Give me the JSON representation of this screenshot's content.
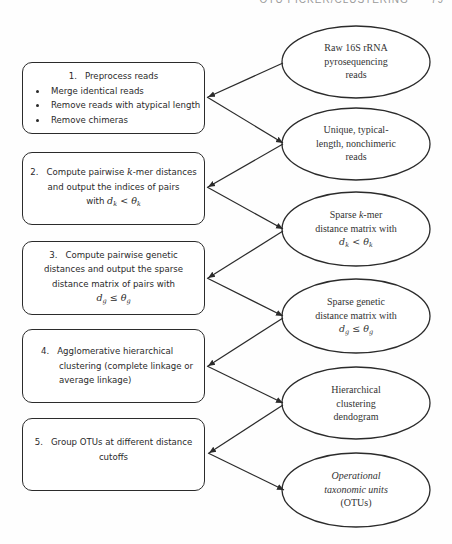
{
  "header": {
    "running_title": "OTU PICKER/CLUSTERING",
    "page_number": "79"
  },
  "steps": [
    {
      "number": "1.",
      "title": "Preprocess reads",
      "bullets": [
        "Merge identical reads",
        "Remove reads with atypical length",
        "Remove chimeras"
      ]
    },
    {
      "number": "2.",
      "line1_pre": "Compute pairwise ",
      "line1_var": "k",
      "line1_post": "-mer distances",
      "line2": "and output the indices of pairs",
      "line3_pre": "with ",
      "math": {
        "d": "d",
        "d_sub": "k",
        "op": "<",
        "theta": "θ",
        "theta_sub": "k"
      }
    },
    {
      "number": "3.",
      "line1": "Compute pairwise genetic",
      "line2": "distances and output the sparse",
      "line3": "distance matrix of pairs with",
      "math": {
        "d": "d",
        "d_sub": "g",
        "op": "≤",
        "theta": "θ",
        "theta_sub": "g"
      }
    },
    {
      "number": "4.",
      "line1": "Agglomerative hierarchical",
      "line2": "clustering (complete linkage or",
      "line3": "average linkage)"
    },
    {
      "number": "5.",
      "line1": "Group OTUs at different distance",
      "line2": "cutoffs"
    }
  ],
  "data_nodes": [
    {
      "lines": [
        "Raw 16S rRNA",
        "pyrosequencing",
        "reads"
      ]
    },
    {
      "lines": [
        "Unique, typical-",
        "length, nonchimeric",
        "reads"
      ]
    },
    {
      "line1_pre": "Sparse ",
      "line1_var": "k",
      "line1_post": "-mer",
      "line2": "distance matrix with",
      "math": {
        "d": "d",
        "d_sub": "k",
        "op": "<",
        "theta": "θ",
        "theta_sub": "k"
      }
    },
    {
      "line1": "Sparse genetic",
      "line2": "distance matrix with",
      "math": {
        "d": "d",
        "d_sub": "g",
        "op": "≤",
        "theta": "θ",
        "theta_sub": "g"
      }
    },
    {
      "lines": [
        "Hierarchical",
        "clustering",
        "dendogram"
      ]
    },
    {
      "line1_italic": "Operational",
      "line2_italic": "taxonomic units",
      "line3": "(OTUs)"
    }
  ],
  "colors": {
    "stroke": "#2b2b2b",
    "text": "#2a2a2a",
    "background": "#ffffff"
  }
}
